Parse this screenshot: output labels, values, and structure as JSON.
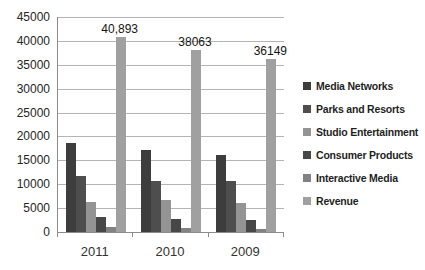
{
  "chart_data": {
    "type": "bar",
    "title": "",
    "xlabel": "",
    "ylabel": "",
    "categories": [
      "2011",
      "2010",
      "2009"
    ],
    "series": [
      {
        "name": "Media Networks",
        "color": "#3d3d3d",
        "values": [
          18714,
          17162,
          16209
        ]
      },
      {
        "name": "Parks and Resorts",
        "color": "#4e4e4e",
        "values": [
          11797,
          10761,
          10667
        ]
      },
      {
        "name": "Studio Entertainment",
        "color": "#949494",
        "values": [
          6351,
          6701,
          6136
        ]
      },
      {
        "name": "Consumer Products",
        "color": "#474747",
        "values": [
          3049,
          2678,
          2425
        ]
      },
      {
        "name": "Interactive Media",
        "color": "#828282",
        "values": [
          982,
          761,
          712
        ]
      },
      {
        "name": "Revenue",
        "color": "#a0a0a0",
        "values": [
          40893,
          38063,
          36149
        ]
      }
    ],
    "data_labels": [
      {
        "category": "2011",
        "series": "Revenue",
        "text": "40,893"
      },
      {
        "category": "2010",
        "series": "Revenue",
        "text": "38063"
      },
      {
        "category": "2009",
        "series": "Revenue",
        "text": "36149"
      }
    ],
    "ylim": [
      0,
      45000
    ],
    "ytick_step": 5000,
    "yticks": [
      "45000",
      "40000",
      "35000",
      "30000",
      "25000",
      "20000",
      "15000",
      "10000",
      "5000",
      "0"
    ],
    "grid": true,
    "legend_position": "right",
    "colors": {
      "gridline": "#b5b5b5",
      "axis": "#8c8c8c",
      "background": "#ffffff"
    }
  }
}
